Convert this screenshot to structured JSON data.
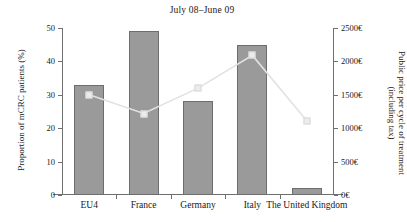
{
  "chart_data": {
    "type": "bar",
    "title": "July 08–June 09",
    "xlabel": "",
    "categories": [
      "EU4",
      "France",
      "Germany",
      "Italy",
      "The United Kingdom"
    ],
    "grid": false,
    "legend": "none",
    "series": [
      {
        "name": "Proportion of mCRC patients (%)",
        "type": "bar",
        "axis": "left",
        "values": [
          33,
          49,
          28,
          45,
          2
        ],
        "color": "#9a9a9a",
        "edge_color": "#6d6d6d"
      },
      {
        "name": "Public price per cycle of treatment (including tax)",
        "type": "line",
        "axis": "right",
        "values": [
          1500,
          1220,
          1600,
          2090,
          1110
        ],
        "color": "#e2e2e2",
        "marker": "square",
        "marker_color": "#ececec"
      }
    ],
    "y_left": {
      "label": "Proportion of mCRC patients (%)",
      "ticks": [
        0,
        10,
        20,
        30,
        40,
        50
      ],
      "tick_labels": [
        "0",
        "10",
        "20",
        "30",
        "40",
        "50"
      ],
      "ylim": [
        0,
        50
      ]
    },
    "y_right": {
      "label": "Public price per cycle of treatment (including tax)",
      "label_line1": "Public price per cycle of treatment",
      "label_line2": "(including tax)",
      "ticks": [
        0,
        500,
        1000,
        1500,
        2000,
        2500
      ],
      "tick_labels": [
        "0€",
        "500€",
        "1000€",
        "1500€",
        "2000€",
        "2500€"
      ],
      "ylim": [
        0,
        2500
      ]
    },
    "colors": {
      "axis": "#6f6f6f",
      "text": "#191919",
      "background": "#ffffff"
    }
  }
}
